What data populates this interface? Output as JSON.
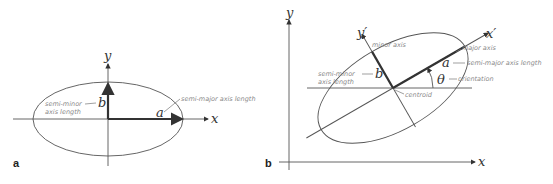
{
  "panel_a": {
    "label": "a",
    "x_axis": "x",
    "y_axis": "y",
    "semi_minor_symbol": "b",
    "semi_major_symbol": "a",
    "semi_minor_note_1": "semi-minor",
    "semi_minor_note_2": "axis length",
    "semi_major_note": "semi-major axis length"
  },
  "panel_b": {
    "label": "b",
    "x_axis": "x",
    "y_axis": "y",
    "x_prime": "x′",
    "y_prime": "y′",
    "minor_axis_note": "minor axis",
    "major_axis_note": "major axis",
    "semi_major_symbol": "a",
    "semi_major_note": "semi-major axis length",
    "semi_minor_symbol": "b",
    "semi_minor_note_1": "semi-minor",
    "semi_minor_note_2": "axis length",
    "theta_symbol": "θ",
    "orientation_note": "orientation",
    "centroid_note": "centroid"
  },
  "colors": {
    "line": "#555555",
    "thick": "#333333",
    "annotation": "#888888"
  }
}
